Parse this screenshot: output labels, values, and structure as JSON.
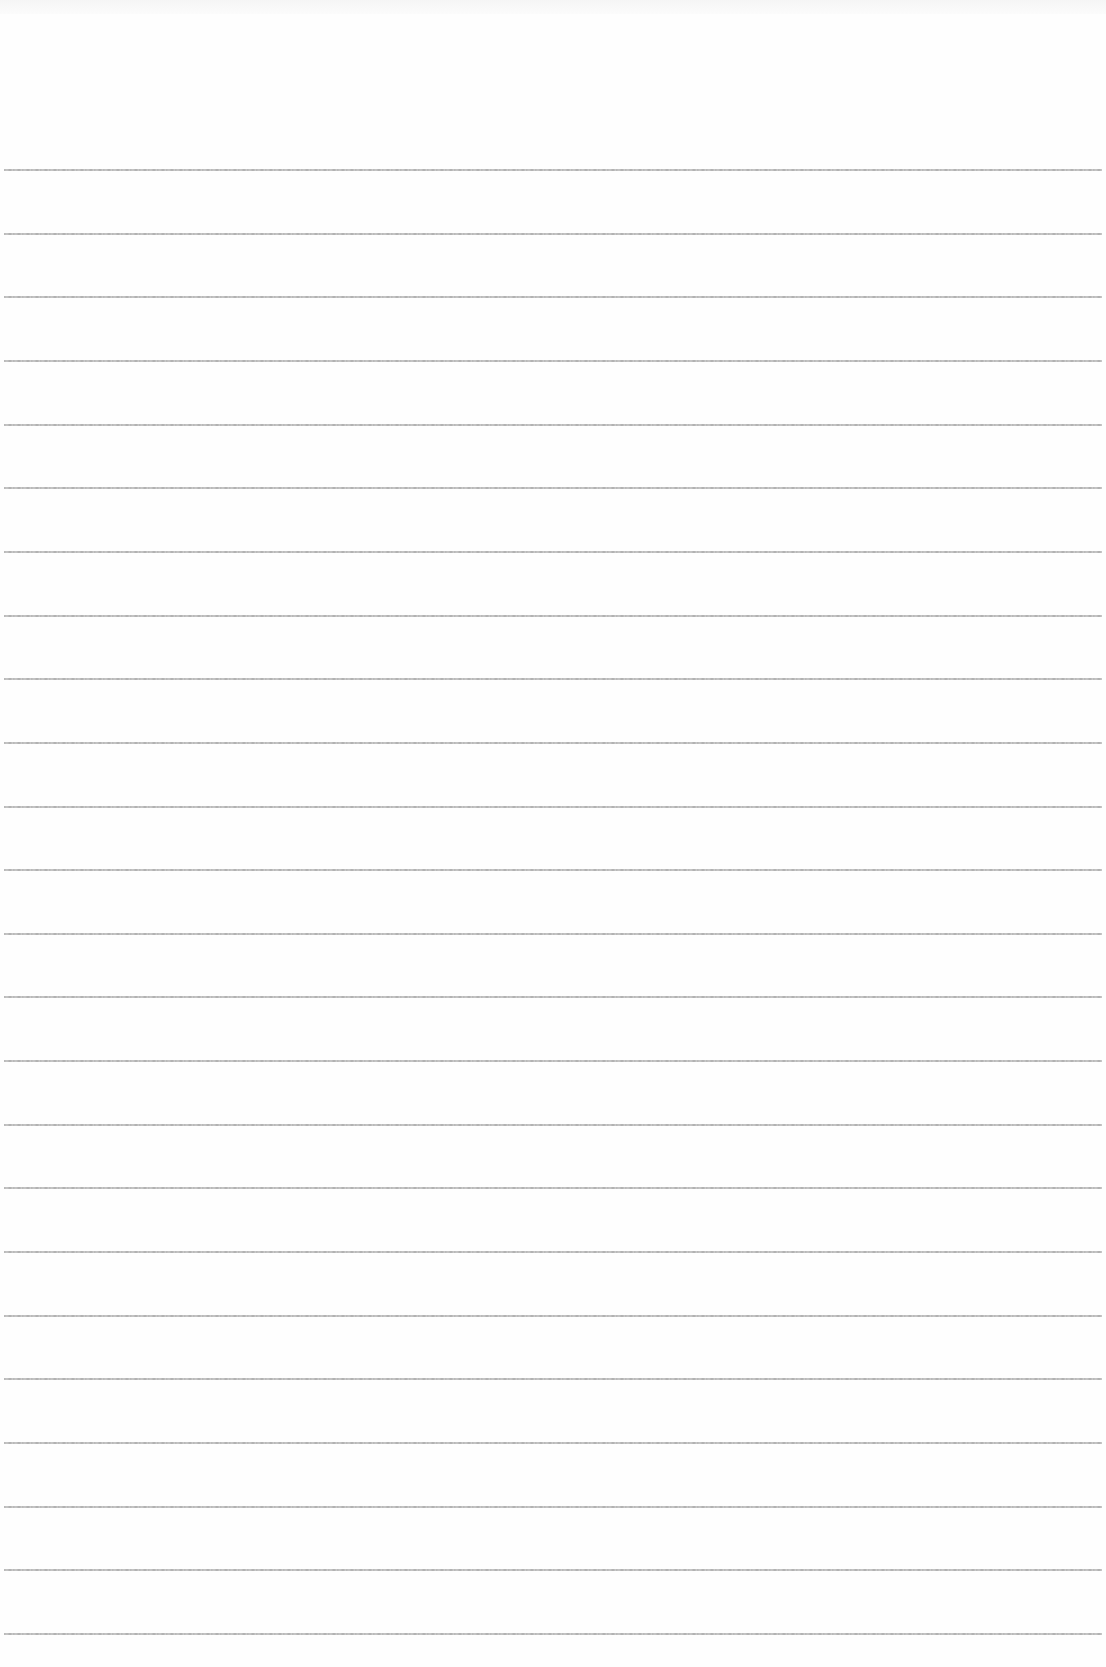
{
  "page": {
    "type": "lined-paper",
    "background_color": "#fefefe",
    "line_color": "#ababab",
    "header_text": "",
    "line_count": 24,
    "first_line_y": 169,
    "line_spacing": 63.65
  }
}
